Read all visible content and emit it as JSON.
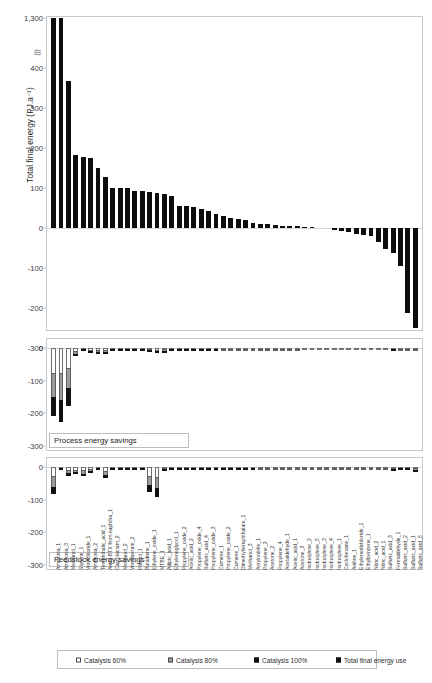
{
  "chart_data": {
    "type": "bar",
    "title": "",
    "ylabel": "Total final energy (PJ.a⁻¹)",
    "xlabel": "",
    "grid": false,
    "legend_position": "bottom",
    "panels": [
      {
        "id": "total-final-energy",
        "caption": "",
        "ylabel": "Total final energy (PJ.a⁻¹)",
        "yticks": [
          "1,300",
          "400",
          "300",
          "200",
          "100",
          "0",
          "-100",
          "-200",
          "-300"
        ],
        "ytick_values": [
          1300,
          400,
          300,
          200,
          100,
          0,
          -100,
          -200,
          -300
        ],
        "ylim": [
          -300,
          430
        ],
        "axis_break": true,
        "axis_break_symbol": "≋",
        "series_name": "Total final energy use",
        "values": [
          1290,
          1275,
          368,
          183,
          178,
          174,
          150,
          127,
          101,
          101,
          100,
          93,
          93,
          91,
          88,
          84,
          80,
          56,
          55,
          52,
          48,
          43,
          36,
          31,
          24,
          22,
          19,
          13,
          11,
          9,
          7,
          6,
          5,
          4,
          3,
          2,
          0,
          0,
          -6,
          -8,
          -11,
          -14,
          -17,
          -20,
          -36,
          -52,
          -62,
          -96,
          -213,
          -288
        ]
      },
      {
        "id": "process-energy-savings",
        "caption": "Process energy savings",
        "yticks": [
          "0",
          "-100",
          "-200",
          "-300"
        ],
        "ytick_values": [
          0,
          -100,
          -200,
          -300
        ],
        "ylim": [
          -300,
          12
        ],
        "series": [
          {
            "name": "Catalysis 60%",
            "values": [
              -208,
              -228,
              -178,
              -26,
              -7,
              -14,
              -15,
              -17,
              -4,
              -4,
              -4,
              -3,
              -3,
              -10,
              -13,
              -11,
              -7,
              -3,
              -3,
              -3,
              -3,
              -3,
              -2,
              -2,
              -2,
              -2,
              -2,
              -2,
              -2,
              -1,
              -1,
              -1,
              -1,
              -1,
              -1,
              -1,
              -1,
              -1,
              -1,
              -1,
              -1,
              -1,
              -1,
              -1,
              -1,
              -1,
              -3,
              -2,
              -2,
              -2
            ]
          },
          {
            "name": "Catalysis 80%",
            "values": [
              -132,
              -150,
              -118,
              -16,
              -4,
              -9,
              -9,
              -11,
              -2,
              -2,
              -2,
              -2,
              -2,
              -6,
              -8,
              -7,
              -4,
              -2,
              -2,
              -2,
              -2,
              -2,
              -1,
              -1,
              -1,
              -1,
              -1,
              -1,
              -1,
              -1,
              -1,
              -1,
              -1,
              -1,
              0,
              0,
              0,
              0,
              0,
              0,
              0,
              0,
              0,
              0,
              0,
              0,
              -2,
              -1,
              -1,
              -1
            ]
          },
          {
            "name": "Catalysis 100%",
            "values": [
              -58,
              -68,
              -55,
              -8,
              -2,
              -4,
              -4,
              -5,
              -1,
              -1,
              -1,
              -1,
              -1,
              -3,
              -4,
              -3,
              -2,
              -1,
              -1,
              -1,
              -1,
              -1,
              -1,
              0,
              0,
              0,
              0,
              0,
              0,
              0,
              0,
              0,
              0,
              0,
              0,
              0,
              0,
              0,
              0,
              0,
              0,
              0,
              0,
              0,
              0,
              0,
              -1,
              0,
              0,
              0
            ]
          }
        ]
      },
      {
        "id": "feedstock-energy-savings",
        "caption": "Feedstock energy savings",
        "yticks": [
          "0",
          "-100",
          "-200",
          "-300"
        ],
        "ytick_values": [
          0,
          -100,
          -200,
          -300
        ],
        "ylim": [
          -300,
          12
        ],
        "series": [
          {
            "name": "Catalysis 60%",
            "values": [
              -84,
              -6,
              -27,
              -21,
              -28,
              -17,
              -7,
              -34,
              -6,
              -6,
              -5,
              -5,
              -5,
              -78,
              -92,
              -8,
              -6,
              -5,
              -5,
              -4,
              -4,
              -4,
              -3,
              -3,
              -3,
              -3,
              -3,
              -3,
              -2,
              -2,
              -2,
              -2,
              -2,
              -2,
              -2,
              -2,
              -2,
              -2,
              -2,
              -2,
              -2,
              -2,
              -1,
              -1,
              -1,
              -1,
              -9,
              -7,
              -7,
              -12
            ]
          },
          {
            "name": "Catalysis 80%",
            "values": [
              -55,
              -4,
              -18,
              -13,
              -18,
              -11,
              -4,
              -22,
              -4,
              -4,
              -3,
              -3,
              -3,
              -50,
              -60,
              -5,
              -4,
              -3,
              -3,
              -3,
              -3,
              -2,
              -2,
              -2,
              -2,
              -2,
              -2,
              -2,
              -1,
              -1,
              -1,
              -1,
              -1,
              -1,
              -1,
              -1,
              -1,
              -1,
              -1,
              -1,
              -1,
              -1,
              -1,
              -1,
              -1,
              -1,
              -6,
              -4,
              -4,
              -8
            ]
          },
          {
            "name": "Catalysis 100%",
            "values": [
              -24,
              -2,
              -8,
              -6,
              -8,
              -5,
              -2,
              -10,
              -2,
              -2,
              -1,
              -1,
              -1,
              -22,
              -27,
              -2,
              -2,
              -1,
              -1,
              -1,
              -1,
              -1,
              -1,
              -1,
              -1,
              -1,
              -1,
              -1,
              0,
              0,
              0,
              0,
              0,
              0,
              0,
              0,
              0,
              0,
              0,
              0,
              0,
              0,
              0,
              0,
              0,
              0,
              -3,
              -2,
              -2,
              -4
            ]
          }
        ]
      }
    ],
    "categories": [
      "Ammonia_1",
      "Ammonia_3",
      "Methanol_1",
      "Styrene_1",
      "Vinylchloride_1",
      "Ammonia_2",
      "Terephthalic_acid_1",
      "Arom-BTX from naphtha_1",
      "Caprolactam_2",
      "Methanol_2",
      "Vinylacetate_2",
      "Phenol_1",
      "Butadiene_1",
      "Ethylene_oxide_1",
      "MTBE_1",
      "Adipic_acid_1",
      "Ethyleneglycol_1",
      "Propylene_oxide_2",
      "Acetic_acid_2",
      "Propylene_oxide_4",
      "Sulfuric_acid_4",
      "Propylene_oxide_3",
      "Cumene_1",
      "Propylene_oxide_2",
      "Cumene_1",
      "Dimethylterephthalate_1",
      "Methanol_3",
      "Acrylonitrile_1",
      "Propylene_3",
      "Acetone_2",
      "Propylene_4",
      "Acetaldehyde_1",
      "Acetic_acid_1",
      "Acetone_3",
      "Isobutylene_2",
      "Isobutylene_5",
      "Isobutylene_3",
      "Isobutylene_4",
      "Isobutylene_1",
      "Cyclohexane_1",
      "Aniline_1",
      "Ethylenedichloride_1",
      "Ethylbenzene_1",
      "Nitric_acid_2",
      "Nitric_acid_1",
      "Sulfuric_acid_3",
      "Formaldehyde_1",
      "Sulfuric_acid_2",
      "Sulfuric_acid_1",
      "Sulfuric_acid_5"
    ],
    "legend": [
      {
        "label": "Catalysis 60%",
        "swatch": "sw60",
        "color": "#ffffff"
      },
      {
        "label": "Catalysis 80%",
        "swatch": "sw80",
        "color": "#9b9b9b"
      },
      {
        "label": "Catalysis 100%",
        "swatch": "sw100",
        "color": "#111111"
      },
      {
        "label": "Total final energy use",
        "swatch": "swtot",
        "color": "#111111"
      }
    ]
  }
}
